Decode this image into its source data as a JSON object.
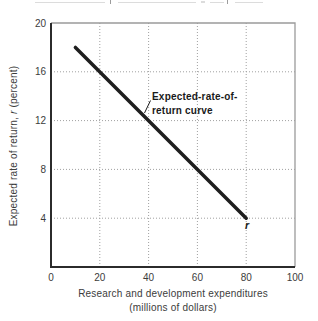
{
  "figure": {
    "background": "#ffffff"
  },
  "chart_data": {
    "type": "line",
    "title": "",
    "xlabel_line1": "Research and development expenditures",
    "xlabel_line2": "(millions of dollars)",
    "ylabel_prefix": "Expected rate of return, ",
    "ylabel_italic": "r",
    "ylabel_suffix": " (percent)",
    "xlim": [
      0,
      100
    ],
    "ylim": [
      0,
      20
    ],
    "x_ticks": [
      0,
      20,
      40,
      60,
      80,
      100
    ],
    "y_ticks": [
      4,
      8,
      12,
      16,
      20
    ],
    "grid": "dotted",
    "legend_position": "none",
    "series": [
      {
        "name": "Expected-rate-of-return curve",
        "points": [
          [
            10,
            18
          ],
          [
            80,
            4
          ]
        ],
        "color": "#1f1f1f",
        "width": 3.5
      }
    ],
    "annotations": {
      "curve_label_line1": "Expected-rate-of-",
      "curve_label_line2": "return curve",
      "end_label": "r"
    }
  },
  "colors": {
    "axis": "#2b2b2b",
    "frame": "#9b9b9b",
    "grid": "#a0a0a0",
    "tick_text": "#3c3c3c",
    "annotation_text": "#1a1a1a"
  }
}
